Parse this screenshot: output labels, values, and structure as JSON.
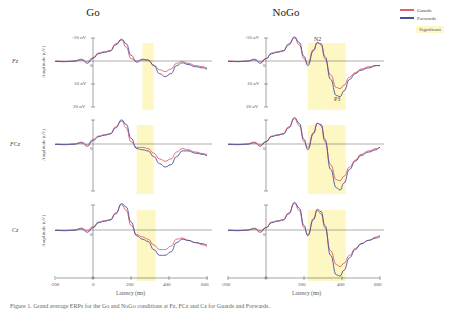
{
  "figure": {
    "columns": [
      "Go",
      "NoGo"
    ],
    "rows": [
      "Fz",
      "FCz",
      "Cz"
    ],
    "y_axis_label": "Amplitude (uV)",
    "y_tick_labels": [
      "-10 uV",
      "0",
      "10 uV",
      "20 uV"
    ],
    "x_axis_label": "Latency (ms)",
    "x_tick_labels": [
      "-200",
      "0",
      "200",
      "400",
      "600"
    ],
    "annotations": {
      "n2": "N2",
      "p3": "P3"
    },
    "legend": {
      "items": [
        {
          "label": "Guards",
          "color": "#e0606a"
        },
        {
          "label": "Forwards",
          "color": "#4a4f9a"
        }
      ],
      "significant_label": "Significant",
      "significant_color": "#fdf6b8"
    },
    "caption": "Figure 1. Grand average ERPs for the Go and NoGo conditions at Fz, FCz and Cz for Guards and Forwards."
  },
  "chart_data": [
    {
      "type": "line",
      "title": "Go - Fz",
      "xlabel": "Latency (ms)",
      "ylabel": "Amplitude (uV)",
      "xlim": [
        -200,
        600
      ],
      "ylim": [
        20,
        -10
      ],
      "x": [
        -200,
        -150,
        -100,
        -60,
        -30,
        0,
        30,
        60,
        90,
        120,
        150,
        175,
        200,
        230,
        260,
        290,
        320,
        350,
        380,
        410,
        440,
        470,
        500,
        540,
        580,
        600
      ],
      "series": [
        {
          "name": "Guards",
          "color": "#e0606a",
          "values": [
            0,
            0.2,
            0,
            -0.8,
            0.3,
            -1.5,
            -3.5,
            -4.0,
            -4.5,
            -7.5,
            -9.0,
            -6,
            -1.0,
            0,
            -0.8,
            -0.3,
            1.8,
            3.8,
            4.6,
            3.5,
            1.0,
            0.2,
            1.0,
            2.0,
            2.5,
            3.0
          ]
        },
        {
          "name": "Forwards",
          "color": "#4a4f9a",
          "values": [
            0.2,
            0.3,
            0.1,
            -0.5,
            1.0,
            -1.2,
            -3.2,
            -3.8,
            -4.3,
            -7.0,
            -9.5,
            -7.5,
            -2.5,
            0.5,
            -0.5,
            -0.5,
            2.0,
            5.5,
            6.8,
            5.5,
            2.0,
            0.8,
            1.5,
            2.5,
            3.0,
            3.5
          ]
        }
      ],
      "significant_windows": [
        [
          260,
          320
        ]
      ]
    },
    {
      "type": "line",
      "title": "NoGo - Fz",
      "xlabel": "Latency (ms)",
      "ylabel": "Amplitude (uV)",
      "xlim": [
        -200,
        600
      ],
      "ylim": [
        20,
        -10
      ],
      "x": [
        -200,
        -150,
        -100,
        -60,
        -30,
        0,
        30,
        60,
        90,
        120,
        150,
        175,
        200,
        220,
        250,
        270,
        290,
        310,
        340,
        370,
        390,
        410,
        440,
        470,
        500,
        540,
        580,
        600
      ],
      "series": [
        {
          "name": "Guards",
          "color": "#e0606a",
          "values": [
            0,
            0.2,
            0,
            -0.8,
            0.3,
            -1.0,
            -3.5,
            -4.0,
            -4.5,
            -7.5,
            -10.0,
            -7,
            -1.0,
            1.0,
            -5,
            -8.0,
            -7,
            -1,
            6,
            11.5,
            12.0,
            10.5,
            7.0,
            5.0,
            3.5,
            2.5,
            2.0,
            2.0
          ]
        },
        {
          "name": "Forwards",
          "color": "#4a4f9a",
          "values": [
            0.2,
            0.3,
            0.1,
            -0.5,
            1.0,
            -1.0,
            -3.2,
            -3.8,
            -4.3,
            -7.0,
            -10.5,
            -8,
            -2.0,
            2.0,
            -4.5,
            -8.0,
            -7.5,
            -2,
            8,
            15.0,
            15.5,
            13.0,
            8.0,
            5.5,
            4.0,
            3.0,
            2.0,
            2.0
          ]
        }
      ],
      "significant_windows": [
        [
          220,
          290
        ],
        [
          290,
          420
        ]
      ]
    },
    {
      "type": "line",
      "title": "Go - FCz",
      "xlabel": "Latency (ms)",
      "ylabel": "Amplitude (uV)",
      "xlim": [
        -200,
        600
      ],
      "ylim": [
        20,
        -10
      ],
      "x": [
        -200,
        -150,
        -100,
        -60,
        -30,
        0,
        30,
        60,
        90,
        120,
        150,
        175,
        200,
        230,
        260,
        290,
        320,
        350,
        380,
        410,
        440,
        470,
        500,
        540,
        580,
        600
      ],
      "series": [
        {
          "name": "Guards",
          "color": "#e0606a",
          "values": [
            0,
            0.2,
            0,
            -0.8,
            0.3,
            -2.0,
            -3.5,
            -4.0,
            -4.5,
            -7.5,
            -10.0,
            -7,
            -1.0,
            1.5,
            1.5,
            2.0,
            4.0,
            6.5,
            7.5,
            6.5,
            3.5,
            2.0,
            2.5,
            3.5,
            4.2,
            4.5
          ]
        },
        {
          "name": "Forwards",
          "color": "#4a4f9a",
          "values": [
            0.2,
            0.3,
            0.1,
            -0.5,
            1.0,
            -1.5,
            -3.2,
            -3.8,
            -4.3,
            -7.0,
            -10.5,
            -8.5,
            -2.5,
            2.0,
            2.5,
            3.0,
            5.5,
            8.5,
            10.0,
            9.0,
            5.5,
            3.0,
            3.0,
            4.0,
            4.5,
            5.0
          ]
        }
      ],
      "significant_windows": [
        [
          230,
          320
        ]
      ]
    },
    {
      "type": "line",
      "title": "NoGo - FCz",
      "xlabel": "Latency (ms)",
      "ylabel": "Amplitude (uV)",
      "xlim": [
        -200,
        600
      ],
      "ylim": [
        20,
        -10
      ],
      "x": [
        -200,
        -150,
        -100,
        -60,
        -30,
        0,
        30,
        60,
        90,
        120,
        150,
        175,
        200,
        220,
        250,
        270,
        290,
        310,
        340,
        370,
        390,
        410,
        440,
        470,
        500,
        540,
        580,
        600
      ],
      "series": [
        {
          "name": "Guards",
          "color": "#e0606a",
          "values": [
            0,
            0.2,
            0,
            -0.8,
            0.3,
            -1.0,
            -3.5,
            -4.0,
            -4.5,
            -7.5,
            -11.0,
            -8,
            -1.0,
            1.5,
            -5,
            -9.0,
            -8,
            -1,
            9,
            15.5,
            16.0,
            14.0,
            10.0,
            7.0,
            4.5,
            3.0,
            2.0,
            1.5
          ]
        },
        {
          "name": "Forwards",
          "color": "#4a4f9a",
          "values": [
            0.2,
            0.3,
            0.1,
            -0.5,
            1.0,
            -1.0,
            -3.2,
            -3.8,
            -4.3,
            -7.0,
            -11.5,
            -9,
            -2.0,
            2.5,
            -4.5,
            -9.0,
            -8.5,
            -2,
            11,
            19.0,
            20.0,
            17.0,
            11.0,
            7.5,
            5.0,
            3.5,
            2.5,
            1.5
          ]
        }
      ],
      "significant_windows": [
        [
          220,
          290
        ],
        [
          290,
          420
        ]
      ]
    },
    {
      "type": "line",
      "title": "Go - Cz",
      "xlabel": "Latency (ms)",
      "ylabel": "Amplitude (uV)",
      "xlim": [
        -200,
        600
      ],
      "ylim": [
        20,
        -10
      ],
      "x": [
        -200,
        -150,
        -100,
        -60,
        -30,
        0,
        30,
        60,
        90,
        120,
        150,
        175,
        200,
        230,
        260,
        290,
        320,
        350,
        380,
        410,
        440,
        470,
        500,
        540,
        580,
        600
      ],
      "series": [
        {
          "name": "Guards",
          "color": "#e0606a",
          "values": [
            0,
            0.2,
            0,
            -0.8,
            0.3,
            -1.5,
            -3.5,
            -4.0,
            -4.5,
            -7.5,
            -11.0,
            -8.5,
            -2.0,
            2.0,
            3.0,
            4.0,
            6.5,
            8.5,
            8.5,
            7.0,
            4.0,
            3.5,
            4.5,
            5.5,
            6.5,
            7.0
          ]
        },
        {
          "name": "Forwards",
          "color": "#4a4f9a",
          "values": [
            0.2,
            0.3,
            0.1,
            -0.5,
            1.0,
            -1.0,
            -3.2,
            -3.8,
            -4.3,
            -7.0,
            -11.5,
            -10.0,
            -3.5,
            2.5,
            4.0,
            5.0,
            8.5,
            11.0,
            11.0,
            9.5,
            5.5,
            4.0,
            4.5,
            5.5,
            6.0,
            6.5
          ]
        }
      ],
      "significant_windows": [
        [
          230,
          330
        ]
      ]
    },
    {
      "type": "line",
      "title": "NoGo - Cz",
      "xlabel": "Latency (ms)",
      "ylabel": "Amplitude (uV)",
      "xlim": [
        -200,
        600
      ],
      "ylim": [
        20,
        -10
      ],
      "x": [
        -200,
        -150,
        -100,
        -60,
        -30,
        0,
        30,
        60,
        90,
        120,
        150,
        175,
        200,
        220,
        250,
        270,
        290,
        310,
        340,
        370,
        390,
        410,
        440,
        470,
        500,
        540,
        580,
        600
      ],
      "series": [
        {
          "name": "Guards",
          "color": "#e0606a",
          "values": [
            0,
            0.2,
            0,
            -0.8,
            0.3,
            -1.0,
            -3.5,
            -4.0,
            -4.5,
            -7.5,
            -11.5,
            -8.5,
            -1.0,
            2.0,
            -5,
            -8.5,
            -7,
            -1,
            9,
            15.0,
            16.0,
            14.5,
            11.0,
            8.0,
            6.0,
            4.5,
            3.0,
            2.5
          ]
        },
        {
          "name": "Forwards",
          "color": "#4a4f9a",
          "values": [
            0.2,
            0.3,
            0.1,
            -0.5,
            1.0,
            -1.0,
            -3.2,
            -3.8,
            -4.3,
            -7.0,
            -12.0,
            -9.5,
            -2.0,
            2.5,
            -4.5,
            -9.0,
            -8.0,
            -2,
            11,
            19.5,
            20.0,
            17.5,
            12.0,
            8.5,
            6.0,
            4.5,
            3.5,
            3.0
          ]
        }
      ],
      "significant_windows": [
        [
          220,
          290
        ],
        [
          290,
          420
        ]
      ]
    }
  ]
}
